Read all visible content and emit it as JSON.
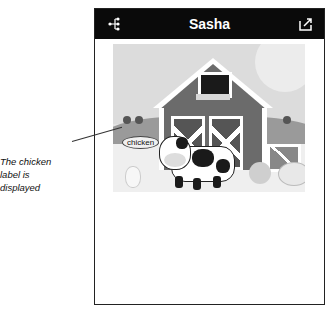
{
  "navbar": {
    "title": "Sasha",
    "left_icon": "share-network-icon",
    "right_icon": "export-icon"
  },
  "scene": {
    "description": "barn farm scene",
    "label": "chicken"
  },
  "annotation": {
    "text": "The chicken label is displayed"
  }
}
